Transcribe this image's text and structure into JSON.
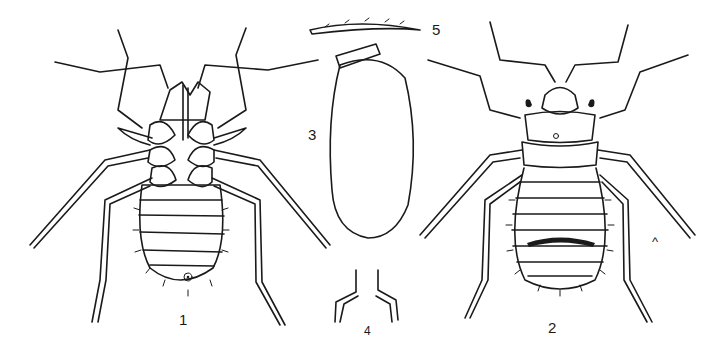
{
  "figure": {
    "type": "scientific-plate",
    "ink_color": "#1a1a1a",
    "background_color": "#ffffff",
    "labels": [
      {
        "id": "1",
        "text": "1",
        "describes": "nymph, ventral view"
      },
      {
        "id": "2",
        "text": "2",
        "describes": "nymph, dorsal view"
      },
      {
        "id": "3",
        "text": "3",
        "describes": "egg with reticulate surface and cap"
      },
      {
        "id": "4",
        "text": "4",
        "describes": "tarsal claws detail"
      },
      {
        "id": "5",
        "text": "5",
        "describes": "bristle / seta detail"
      }
    ],
    "stray_mark": "^"
  }
}
